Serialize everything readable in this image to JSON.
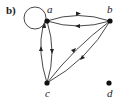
{
  "figure": {
    "panel_label": "b)",
    "nodes": [
      {
        "id": "a",
        "label": "a"
      },
      {
        "id": "b",
        "label": "b"
      },
      {
        "id": "c",
        "label": "c"
      },
      {
        "id": "d",
        "label": "d"
      }
    ],
    "edges": [
      {
        "from": "a",
        "to": "a",
        "type": "loop"
      },
      {
        "from": "a",
        "to": "b"
      },
      {
        "from": "b",
        "to": "a"
      },
      {
        "from": "a",
        "to": "c"
      },
      {
        "from": "c",
        "to": "a"
      },
      {
        "from": "c",
        "to": "b"
      },
      {
        "from": "b",
        "to": "c"
      }
    ],
    "colors": {
      "ink": "#222222",
      "background": "#ffffff"
    }
  }
}
